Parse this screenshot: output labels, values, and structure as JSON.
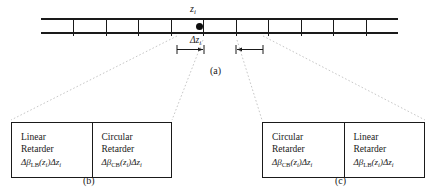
{
  "figure": {
    "panel_a": {
      "caption": "(a)",
      "position_label": "z",
      "position_label_sub": "i",
      "thickness_label": "Δz",
      "thickness_label_sub": "i",
      "segment_count": 11,
      "marker": "center-dot"
    },
    "panel_b": {
      "caption": "(b)",
      "cells": [
        {
          "line1": "Linear",
          "line2": "Retarder",
          "formula_prefix": "Δβ",
          "formula_sub": "LB",
          "formula_arg_open": "(z",
          "formula_arg_sub": "i",
          "formula_arg_close": ")Δz",
          "formula_tail_sub": "i"
        },
        {
          "line1": "Circular",
          "line2": "Retarder",
          "formula_prefix": "Δβ",
          "formula_sub": "CB",
          "formula_arg_open": "(z",
          "formula_arg_sub": "i",
          "formula_arg_close": ")Δz",
          "formula_tail_sub": "i"
        }
      ]
    },
    "panel_c": {
      "caption": "(c)",
      "cells": [
        {
          "line1": "Circular",
          "line2": "Retarder",
          "formula_prefix": "Δβ",
          "formula_sub": "CB",
          "formula_arg_open": "(z",
          "formula_arg_sub": "i",
          "formula_arg_close": ")Δz",
          "formula_tail_sub": "i"
        },
        {
          "line1": "Linear",
          "line2": "Retarder",
          "formula_prefix": "Δβ",
          "formula_sub": "LB",
          "formula_arg_open": "(z",
          "formula_arg_sub": "i",
          "formula_arg_close": ")Δz",
          "formula_tail_sub": "i"
        }
      ]
    },
    "colors": {
      "ink": "#1a1a1a",
      "background": "#ffffff",
      "guide": "#b9b9b9"
    }
  }
}
